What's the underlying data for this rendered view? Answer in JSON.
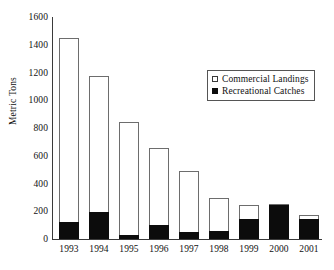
{
  "chart_data": {
    "type": "bar",
    "stacked": true,
    "title": "",
    "subtitle": "",
    "xlabel": "",
    "ylabel": "Metric Tons",
    "categories": [
      "1993",
      "1994",
      "1995",
      "1996",
      "1997",
      "1998",
      "1999",
      "2000",
      "2001"
    ],
    "series": [
      {
        "name": "Commercial Landings",
        "swatch": "open-square",
        "color": "#ffffff",
        "values": [
          1325,
          980,
          815,
          555,
          440,
          235,
          100,
          5,
          25
        ]
      },
      {
        "name": "Recreational Catches",
        "swatch": "filled-square",
        "color": "#0c0c0c",
        "values": [
          125,
          195,
          30,
          100,
          50,
          60,
          145,
          245,
          145
        ]
      }
    ],
    "totals": [
      1450,
      1175,
      845,
      655,
      490,
      295,
      245,
      250,
      170
    ],
    "ylim": [
      0,
      1600
    ],
    "yticks": [
      0,
      200,
      400,
      600,
      800,
      1000,
      1200,
      1400,
      1600
    ],
    "ytick_labels": [
      "0",
      "200",
      "400",
      "600",
      "800",
      "1000",
      "1200",
      "1400",
      "1600"
    ],
    "grid": false,
    "legend_position": "upper-right-inside"
  },
  "axis": {
    "y_title": "Metric Tons"
  },
  "legend": {
    "entries": [
      {
        "label": "Commercial Landings",
        "swatch": "open-square"
      },
      {
        "label": "Recreational Catches",
        "swatch": "filled-square"
      }
    ]
  }
}
